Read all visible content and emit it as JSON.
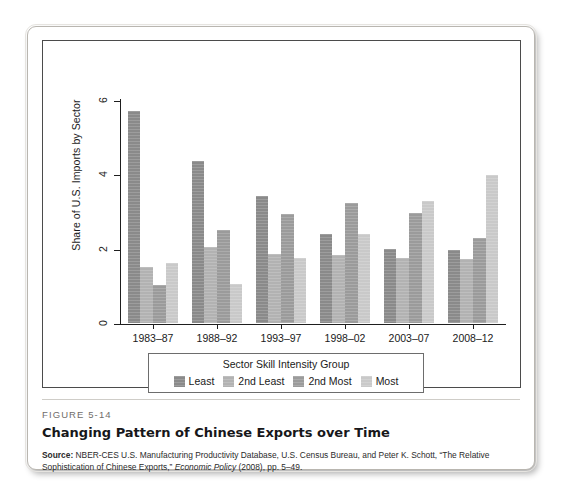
{
  "figure": {
    "number_label": "FIGURE 5-14",
    "title": "Changing Pattern of Chinese Exports over Time",
    "source_label": "Source:",
    "source_text_1": " NBER-CES U.S. Manufacturing Productivity Database, U.S. Census Bureau, and Peter K. Schott, “The Relative Sophistication of Chinese Exports,” ",
    "source_italic": "Economic Policy",
    "source_text_2": " (2008), pp. 5–49."
  },
  "chart_data": {
    "type": "bar",
    "title": "",
    "xlabel": "",
    "ylabel": "Share of U.S. Imports by Sector",
    "ylim": [
      0,
      6.4
    ],
    "yticks": [
      0,
      2,
      4,
      6
    ],
    "ytick_labels": [
      "0",
      "2",
      "4",
      "6"
    ],
    "grid": false,
    "legend_position": "bottom-center",
    "legend_title": "Sector Skill Intensity Group",
    "categories": [
      "1983–87",
      "1988–92",
      "1993–97",
      "1998–02",
      "2003–07",
      "2008–12"
    ],
    "series": [
      {
        "name": "Least",
        "color": "#8a8a8a",
        "values": [
          5.7,
          4.35,
          3.41,
          2.4,
          1.98,
          1.97
        ]
      },
      {
        "name": "2nd Least",
        "color": "#b2b2b2",
        "values": [
          1.51,
          2.05,
          1.86,
          1.82,
          1.76,
          1.72
        ]
      },
      {
        "name": "2nd Most",
        "color": "#9b9b9b",
        "values": [
          1.03,
          2.49,
          2.92,
          3.24,
          2.97,
          2.28
        ]
      },
      {
        "name": "Most",
        "color": "#c9c9c9",
        "values": [
          1.62,
          1.05,
          1.76,
          2.39,
          3.27,
          3.97
        ]
      }
    ]
  }
}
